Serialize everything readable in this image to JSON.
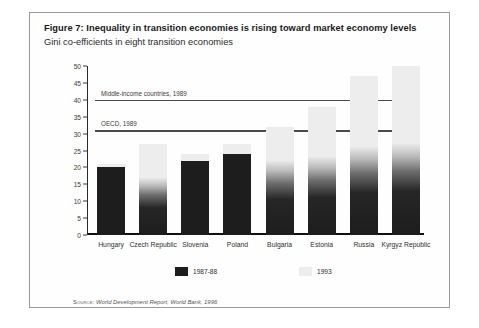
{
  "figure": {
    "title": "Figure 7: Inequality in transition economies is rising toward market economy levels",
    "subtitle": "Gini co-efficients in eight transition economies",
    "source_word": "Source:",
    "source_text": "World Development Report, World Bank, 1996"
  },
  "legend": {
    "items": [
      {
        "label": "1987-88",
        "color": "#1d1d1d"
      },
      {
        "label": "1993",
        "color": "#ededed"
      }
    ]
  },
  "chart_data": {
    "type": "bar",
    "title": "Gini co-efficients in eight transition economies",
    "xlabel": "",
    "ylabel": "",
    "ylim": [
      0,
      50
    ],
    "yticks": [
      0,
      5,
      10,
      15,
      20,
      25,
      30,
      35,
      40,
      45,
      50
    ],
    "grid": false,
    "stacked": true,
    "legend_position": "bottom",
    "categories": [
      "Hungary",
      "Czech Republic",
      "Slovenia",
      "Poland",
      "Bulgaria",
      "Estonia",
      "Russia",
      "Kyrgyz Republic"
    ],
    "series": [
      {
        "name": "1987-88",
        "color": "#1d1d1d",
        "values": [
          20,
          17,
          22,
          24,
          22,
          23,
          26,
          27
        ]
      },
      {
        "name": "1993",
        "color": "#ededed",
        "values": [
          21,
          27,
          24,
          27,
          32,
          38,
          47,
          50
        ]
      }
    ],
    "reference_lines": [
      {
        "label": "Middle-income countries, 1989",
        "value": 40
      },
      {
        "label": "OECD, 1989",
        "value": 31
      }
    ]
  }
}
